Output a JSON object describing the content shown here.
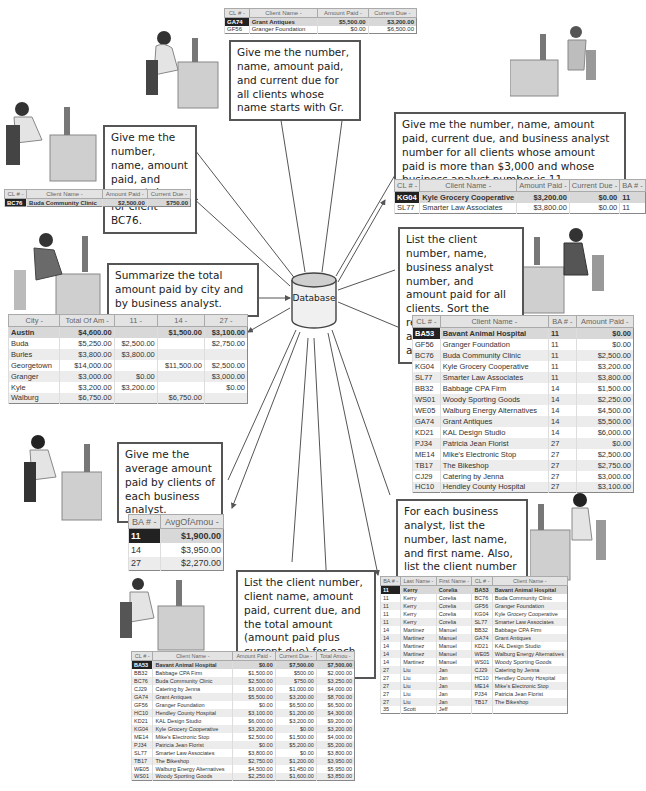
{
  "center": {
    "label": "Database"
  },
  "queries": [
    {
      "id": "gr",
      "text": "Give me the number, name, amount paid, and current due for all clients whose name starts with Gr."
    },
    {
      "id": "bc76",
      "text": "Give me the number, name, amount paid, and current due for client BC76."
    },
    {
      "id": "ba11",
      "text": "Give me the number, name, amount paid, current due, and business analyst number for all clients whose amount paid is more than $3,000 and whose business analyst number is 11."
    },
    {
      "id": "summarize",
      "text": "Summarize the total amount paid by city and by business analyst."
    },
    {
      "id": "sort",
      "text": "List the client number, name, business analyst number, and amount paid for all clients. Sort the results by business analyst number and amount paid."
    },
    {
      "id": "average",
      "text": "Give me the average amount paid by clients of each business analyst."
    },
    {
      "id": "foreach",
      "text": "For each business analyst, list the number, last name, and first name. Also, list the client number and name for each of the business analyst's clients."
    },
    {
      "id": "total",
      "text": "List the client number, client name, amount paid, current due, and the total amount (amount paid plus current due) for each client."
    }
  ],
  "tables": {
    "gr": {
      "headers": [
        "CL # -",
        "Client Name -",
        "Amount Paid -",
        "Current Due -"
      ],
      "rows": [
        [
          "GA74",
          "Grant Antiques",
          "$5,500.00",
          "$3,200.00"
        ],
        [
          "GF56",
          "Granger Foundation",
          "$0.00",
          "$6,500.00"
        ]
      ]
    },
    "bc76": {
      "headers": [
        "CL # -",
        "Client Name -",
        "Amount Paid -",
        "Current Due -"
      ],
      "rows": [
        [
          "BC76",
          "Buda Community Clinic",
          "$2,500.00",
          "$750.00"
        ]
      ]
    },
    "ba11": {
      "headers": [
        "CL # -",
        "Client Name -",
        "Amount Paid -",
        "Current Due -",
        "BA # -"
      ],
      "rows": [
        [
          "KG04",
          "Kyle Grocery Cooperative",
          "$3,200.00",
          "$0.00",
          "11"
        ],
        [
          "SL77",
          "Smarter Law Associates",
          "$3,800.00",
          "$0.00",
          "11"
        ]
      ]
    },
    "summarize": {
      "headers": [
        "City -",
        "Total Of Am -",
        "11 -",
        "14 -",
        "27 -"
      ],
      "rows": [
        [
          "Austin",
          "$4,600.00",
          "",
          "$1,500.00",
          "$3,100.00"
        ],
        [
          "Buda",
          "$5,250.00",
          "$2,500.00",
          "",
          "$2,750.00"
        ],
        [
          "Burles",
          "$3,800.00",
          "$3,800.00",
          "",
          ""
        ],
        [
          "Georgetown",
          "$14,000.00",
          "",
          "$11,500.00",
          "$2,500.00"
        ],
        [
          "Granger",
          "$3,000.00",
          "$0.00",
          "",
          "$3,000.00"
        ],
        [
          "Kyle",
          "$3,200.00",
          "$3,200.00",
          "",
          "$0.00"
        ],
        [
          "Walburg",
          "$6,750.00",
          "",
          "$6,750.00",
          ""
        ]
      ]
    },
    "sort": {
      "headers": [
        "CL # -",
        "Client Name -",
        "BA # -",
        "Amount Paid -"
      ],
      "rows": [
        [
          "BA53",
          "Bavant Animal Hospital",
          "11",
          "$0.00"
        ],
        [
          "GF56",
          "Granger Foundation",
          "11",
          "$0.00"
        ],
        [
          "BC76",
          "Buda Community Clinic",
          "11",
          "$2,500.00"
        ],
        [
          "KG04",
          "Kyle Grocery Cooperative",
          "11",
          "$3,200.00"
        ],
        [
          "SL77",
          "Smarter Law Associates",
          "11",
          "$3,800.00"
        ],
        [
          "BB32",
          "Babbage CPA Firm",
          "14",
          "$1,500.00"
        ],
        [
          "WS01",
          "Woody Sporting Goods",
          "14",
          "$2,250.00"
        ],
        [
          "WE05",
          "Walburg Energy Alternatives",
          "14",
          "$4,500.00"
        ],
        [
          "GA74",
          "Grant Antiques",
          "14",
          "$5,500.00"
        ],
        [
          "KD21",
          "KAL Design Studio",
          "14",
          "$6,000.00"
        ],
        [
          "PJ34",
          "Patricia Jean Florist",
          "27",
          "$0.00"
        ],
        [
          "ME14",
          "Mike's Electronic Stop",
          "27",
          "$2,500.00"
        ],
        [
          "TB17",
          "The Bikeshop",
          "27",
          "$2,750.00"
        ],
        [
          "CJ29",
          "Catering by Jenna",
          "27",
          "$3,000.00"
        ],
        [
          "HC10",
          "Hendley County Hospital",
          "27",
          "$3,100.00"
        ]
      ]
    },
    "average": {
      "headers": [
        "BA # -",
        "AvgOfAmou -"
      ],
      "rows": [
        [
          "11",
          "$1,900.00"
        ],
        [
          "14",
          "$3,950.00"
        ],
        [
          "27",
          "$2,270.00"
        ]
      ]
    },
    "foreach": {
      "headers": [
        "BA # -",
        "Last Name -",
        "First Name -",
        "CL # -",
        "Client Name -"
      ],
      "rows": [
        [
          "11",
          "Kerry",
          "Corelia",
          "BA53",
          "Bavant Animal Hospital"
        ],
        [
          "11",
          "Kerry",
          "Corelia",
          "BC76",
          "Buda Community Clinic"
        ],
        [
          "11",
          "Kerry",
          "Corelia",
          "GF56",
          "Granger Foundation"
        ],
        [
          "11",
          "Kerry",
          "Corelia",
          "KG04",
          "Kyle Grocery Cooperative"
        ],
        [
          "11",
          "Kerry",
          "Corelia",
          "SL77",
          "Smarter Law Associates"
        ],
        [
          "14",
          "Martinez",
          "Manuel",
          "BB32",
          "Babbage CPA Firm"
        ],
        [
          "14",
          "Martinez",
          "Manuel",
          "GA74",
          "Grant Antiques"
        ],
        [
          "14",
          "Martinez",
          "Manuel",
          "KD21",
          "KAL Design Studio"
        ],
        [
          "14",
          "Martinez",
          "Manuel",
          "WE05",
          "Walburg Energy Alternatives"
        ],
        [
          "14",
          "Martinez",
          "Manuel",
          "WS01",
          "Woody Sporting Goods"
        ],
        [
          "27",
          "Liu",
          "Jan",
          "CJ29",
          "Catering by Jenna"
        ],
        [
          "27",
          "Liu",
          "Jan",
          "HC10",
          "Hendley County Hospital"
        ],
        [
          "27",
          "Liu",
          "Jan",
          "ME14",
          "Mike's Electronic Stop"
        ],
        [
          "27",
          "Liu",
          "Jan",
          "PJ34",
          "Patricia Jean Florist"
        ],
        [
          "27",
          "Liu",
          "Jan",
          "TB17",
          "The Bikeshop"
        ],
        [
          "35",
          "Scott",
          "Jeff",
          "",
          ""
        ]
      ]
    },
    "total": {
      "headers": [
        "CL # -",
        "Client Name -",
        "Amount Paid -",
        "Current Due -",
        "Total Amou -"
      ],
      "rows": [
        [
          "BA53",
          "Bavant Animal Hospital",
          "$0.00",
          "$7,500.00",
          "$7,500.00"
        ],
        [
          "BB32",
          "Babbage CPA Firm",
          "$1,500.00",
          "$500.00",
          "$2,000.00"
        ],
        [
          "BC76",
          "Buda Community Clinic",
          "$2,500.00",
          "$750.00",
          "$3,250.00"
        ],
        [
          "CJ29",
          "Catering by Jenna",
          "$3,000.00",
          "$1,000.00",
          "$4,000.00"
        ],
        [
          "GA74",
          "Grant Antiques",
          "$5,500.00",
          "$3,200.00",
          "$8,700.00"
        ],
        [
          "GF56",
          "Granger Foundation",
          "$0.00",
          "$6,500.00",
          "$6,500.00"
        ],
        [
          "HC10",
          "Hendley County Hospital",
          "$3,100.00",
          "$1,200.00",
          "$4,300.00"
        ],
        [
          "KD21",
          "KAL Design Studio",
          "$6,000.00",
          "$3,200.00",
          "$9,200.00"
        ],
        [
          "KG04",
          "Kyle Grocery Cooperative",
          "$3,200.00",
          "$0.00",
          "$3,200.00"
        ],
        [
          "ME14",
          "Mike's Electronic Stop",
          "$2,500.00",
          "$1,500.00",
          "$4,000.00"
        ],
        [
          "PJ34",
          "Patricia Jean Florist",
          "$0.00",
          "$5,200.00",
          "$5,200.00"
        ],
        [
          "SL77",
          "Smarter Law Associates",
          "$3,800.00",
          "$0.00",
          "$3,800.00"
        ],
        [
          "TB17",
          "The Bikeshop",
          "$2,750.00",
          "$1,200.00",
          "$3,950.00"
        ],
        [
          "WE05",
          "Walburg Energy Alternatives",
          "$4,500.00",
          "$1,450.00",
          "$5,950.00"
        ],
        [
          "WS01",
          "Woody Sporting Goods",
          "$2,250.00",
          "$1,600.00",
          "$3,850.00"
        ]
      ]
    }
  }
}
